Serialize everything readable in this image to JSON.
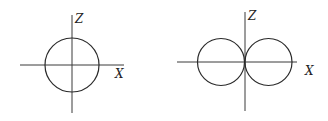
{
  "diagrams": [
    {
      "name": "s-orbital-polar-plot",
      "shape": "circle",
      "axes": {
        "vertical_label": "Z",
        "horizontal_label": "X"
      }
    },
    {
      "name": "p-orbital-polar-plot",
      "shape": "two tangent lobes along X",
      "axes": {
        "vertical_label": "Z",
        "horizontal_label": "X"
      }
    }
  ],
  "colors": {
    "line": "#2a2a2a",
    "background": "#ffffff"
  }
}
